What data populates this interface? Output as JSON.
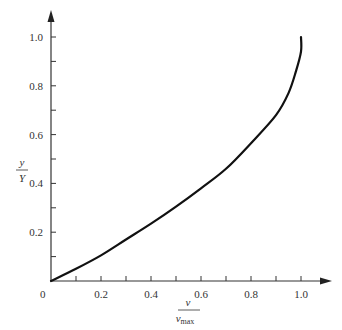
{
  "chart_data": {
    "type": "line",
    "title": "",
    "xlabel": "v / v_max",
    "ylabel": "y / Y",
    "xlabel_parts": {
      "num": "v",
      "den": "v",
      "den_sub": "max"
    },
    "ylabel_parts": {
      "num": "y",
      "den": "Y"
    },
    "xlim": [
      0,
      1.1
    ],
    "ylim": [
      0,
      1.1
    ],
    "grid": false,
    "legend": null,
    "x_ticks": [
      "0.2",
      "0.4",
      "0.6",
      "0.8",
      "1.0"
    ],
    "y_ticks": [
      "0.2",
      "0.4",
      "0.6",
      "0.8",
      "1.0"
    ],
    "origin_label": "0",
    "series": [
      {
        "name": "velocity profile",
        "x": [
          0.0,
          0.1,
          0.2,
          0.3,
          0.4,
          0.5,
          0.6,
          0.7,
          0.8,
          0.9,
          0.95,
          0.98,
          1.0,
          1.0
        ],
        "y": [
          0.0,
          0.05,
          0.105,
          0.17,
          0.235,
          0.305,
          0.38,
          0.46,
          0.565,
          0.68,
          0.77,
          0.86,
          0.94,
          1.0
        ]
      }
    ]
  }
}
